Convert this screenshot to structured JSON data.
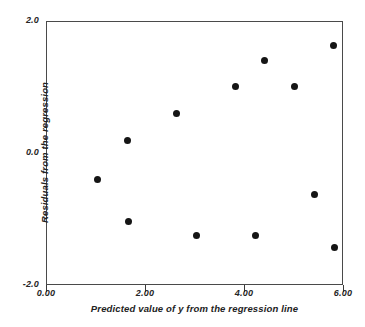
{
  "chart_data": {
    "type": "scatter",
    "title": "",
    "xlabel": "Predicted value of y from the regression line",
    "ylabel": "Residuals from the regression",
    "xlim": [
      0.0,
      6.0
    ],
    "ylim": [
      -2.0,
      2.0
    ],
    "xticks": [
      0.0,
      2.0,
      4.0,
      6.0
    ],
    "xtick_labels": [
      "0.00",
      "2.00",
      "4.00",
      "6.00"
    ],
    "yticks": [
      -2.0,
      0.0,
      2.0
    ],
    "ytick_labels": [
      "-2.0",
      "0.0",
      "2.0"
    ],
    "grid": false,
    "legend": null,
    "marker": {
      "shape": "circle",
      "color": "#151515",
      "size_px": 7
    },
    "series": [
      {
        "name": "residuals",
        "points": [
          {
            "x": 1.03,
            "y": -0.39
          },
          {
            "x": 1.62,
            "y": 0.21
          },
          {
            "x": 1.64,
            "y": -1.02
          },
          {
            "x": 2.61,
            "y": 0.61
          },
          {
            "x": 3.03,
            "y": -1.23
          },
          {
            "x": 3.8,
            "y": 1.03
          },
          {
            "x": 4.22,
            "y": -1.23
          },
          {
            "x": 4.4,
            "y": 1.42
          },
          {
            "x": 5.01,
            "y": 1.03
          },
          {
            "x": 5.41,
            "y": -0.62
          },
          {
            "x": 5.78,
            "y": 1.64
          },
          {
            "x": 5.8,
            "y": -1.42
          }
        ]
      }
    ]
  },
  "colors": {
    "background": "#ffffff",
    "axis": "#4a4a4a",
    "marker": "#151515",
    "text": "#222222"
  }
}
